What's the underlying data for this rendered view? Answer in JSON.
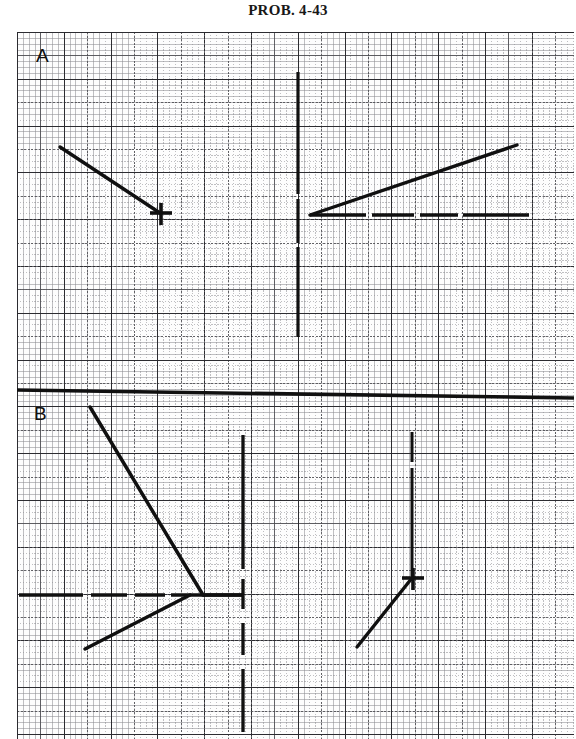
{
  "title": "PROB. 4-43",
  "figure": {
    "type": "vector-diagram-worksheet",
    "background": "graph-paper",
    "ink_color": "#101010",
    "grid": {
      "fine_spacing_px": 5.85,
      "medium_spacing_px": 23.4,
      "heavy_spacing_px": 46.8,
      "style": "dotted"
    },
    "panels": [
      {
        "id": "A",
        "label": "A",
        "label_pos": [
          19,
          14
        ],
        "elements": [
          {
            "name": "vector-down-right-with-cross-tip",
            "kind": "line-with-cross-marker",
            "from": [
              43,
              115
            ],
            "to": [
              143,
              181
            ],
            "marker": "plus-cross"
          },
          {
            "name": "vertical-axis-line",
            "kind": "dashed-line",
            "from": [
              281,
              40
            ],
            "to": [
              281,
              346
            ]
          },
          {
            "name": "horizontal-baseline",
            "kind": "dashed-line",
            "from": [
              293,
              183
            ],
            "to": [
              529,
              183
            ]
          },
          {
            "name": "vector-up-right",
            "kind": "line",
            "from": [
              293,
              183
            ],
            "to": [
              500,
              113
            ]
          }
        ]
      },
      {
        "id": "B",
        "label": "B",
        "label_pos": [
          17,
          372
        ],
        "elements": [
          {
            "name": "vector-down-right-long",
            "kind": "line",
            "from": [
              73,
              375
            ],
            "to": [
              186,
              563
            ]
          },
          {
            "name": "horizontal-baseline",
            "kind": "dashed-line",
            "from": [
              3,
              563
            ],
            "to": [
              224,
              563
            ]
          },
          {
            "name": "vector-down-left",
            "kind": "line",
            "from": [
              173,
              563
            ],
            "to": [
              68,
              616
            ]
          },
          {
            "name": "vertical-axis-line",
            "kind": "dashed-line",
            "from": [
              226,
              403
            ],
            "to": [
              226,
              700
            ]
          },
          {
            "name": "vertical-line-right-with-cross",
            "kind": "line-with-cross-marker",
            "from": [
              395,
              400
            ],
            "to": [
              395,
              545
            ],
            "marker": "plus-cross"
          },
          {
            "name": "vector-up-right-short",
            "kind": "line",
            "from": [
              340,
              614
            ],
            "to": [
              395,
              545
            ]
          }
        ]
      }
    ],
    "panel_divider": {
      "name": "panel-divider",
      "kind": "thick-line",
      "from": [
        0,
        358
      ],
      "to": [
        557,
        366
      ]
    }
  }
}
